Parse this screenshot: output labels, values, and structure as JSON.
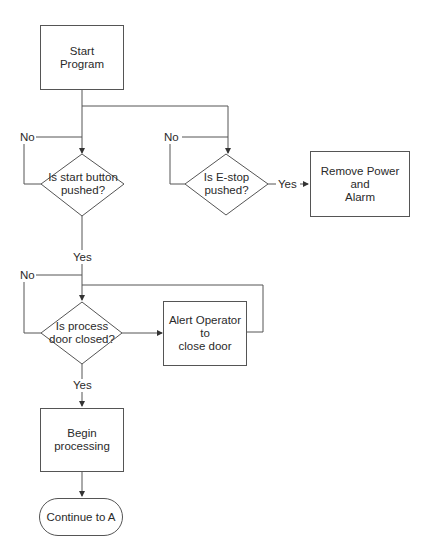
{
  "flowchart": {
    "nodes": {
      "start": {
        "type": "process",
        "text": "Start\nProgram"
      },
      "start_button_decision": {
        "type": "decision",
        "text": "Is start button\npushed?"
      },
      "estop_decision": {
        "type": "decision",
        "text": "Is E-stop\npushed?"
      },
      "remove_power": {
        "type": "process",
        "text": "Remove Power and\nAlarm"
      },
      "door_decision": {
        "type": "decision",
        "text": "Is process\ndoor closed?"
      },
      "alert_operator": {
        "type": "process",
        "text": "Alert Operator to\nclose door"
      },
      "begin_processing": {
        "type": "process",
        "text": "Begin\nprocessing"
      },
      "continue_a": {
        "type": "terminator",
        "text": "Continue to A"
      }
    },
    "labels": {
      "start_no": "No",
      "start_yes": "Yes",
      "estop_no": "No",
      "estop_yes": "Yes",
      "door_no": "No",
      "door_yes": "Yes"
    },
    "edges": [
      {
        "from": "start",
        "to": "start_button_decision"
      },
      {
        "from": "start",
        "to": "estop_decision"
      },
      {
        "from": "start_button_decision",
        "to": "start_button_decision",
        "label": "No"
      },
      {
        "from": "start_button_decision",
        "to": "door_decision",
        "label": "Yes"
      },
      {
        "from": "estop_decision",
        "to": "estop_decision",
        "label": "No"
      },
      {
        "from": "estop_decision",
        "to": "remove_power",
        "label": "Yes"
      },
      {
        "from": "door_decision",
        "to": "door_decision",
        "label": "No"
      },
      {
        "from": "door_decision",
        "to": "alert_operator"
      },
      {
        "from": "alert_operator",
        "to": "door_decision"
      },
      {
        "from": "door_decision",
        "to": "begin_processing",
        "label": "Yes"
      },
      {
        "from": "begin_processing",
        "to": "continue_a"
      }
    ],
    "colors": {
      "line": "#555555",
      "text": "#2a2a2a",
      "background": "#ffffff"
    }
  },
  "text": {
    "start_l1": "Start",
    "start_l2": "Program",
    "sb_l1": "Is start button",
    "sb_l2": "pushed?",
    "es_l1": "Is E-stop",
    "es_l2": "pushed?",
    "rp_l1": "Remove Power and",
    "rp_l2": "Alarm",
    "dd_l1": "Is process",
    "dd_l2": "door closed?",
    "ao_l1": "Alert Operator to",
    "ao_l2": "close door",
    "bp_l1": "Begin",
    "bp_l2": "processing",
    "ca": "Continue to A"
  }
}
